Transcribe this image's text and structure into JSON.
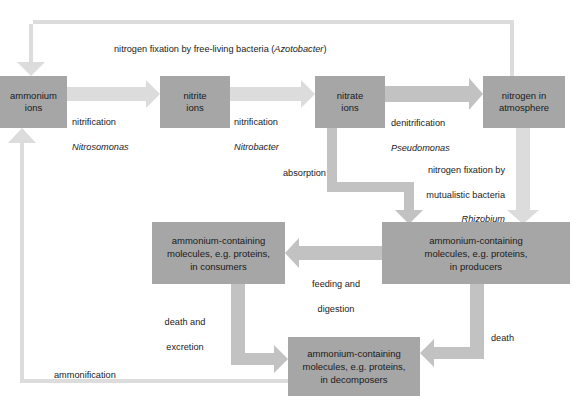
{
  "diagram": {
    "title_caption": "nitrogen fixation by free-living bacteria (Azotobacter)",
    "nodes": [
      {
        "id": "ammonium_ions",
        "label": "ammonium\nions"
      },
      {
        "id": "nitrite_ions",
        "label": "nitrite\nions"
      },
      {
        "id": "nitrate_ions",
        "label": "nitrate\nions"
      },
      {
        "id": "nitrogen_atmosphere",
        "label": "nitrogen in\natmosphere"
      },
      {
        "id": "consumers",
        "label": "ammonium-containing\nmolecules, e.g. proteins,\nin consumers"
      },
      {
        "id": "producers",
        "label": "ammonium-containing\nmolecules, e.g. proteins,\nin producers"
      },
      {
        "id": "decomposers",
        "label": "ammonium-containing\nmolecules, e.g. proteins,\nin decomposers"
      }
    ],
    "edge_labels": {
      "free_living_fixation": "nitrogen fixation by free-living bacteria (Azotobacter)",
      "free_living_fixation_plain": "nitrogen fixation by free-living bacteria (",
      "free_living_fixation_italic": "Azotobacter",
      "free_living_fixation_tail": ")",
      "nitrification_1_line1": "nitrification",
      "nitrification_1_line2": "Nitrosomonas",
      "nitrification_2_line1": "nitrification",
      "nitrification_2_line2": "Nitrobacter",
      "denitrification_line1": "denitrification",
      "denitrification_line2": "Pseudomonas",
      "absorption": "absorption",
      "mutualistic_line1": "nitrogen fixation by",
      "mutualistic_line2": "mutualistic bacteria",
      "mutualistic_line3": "Rhizobium",
      "feeding_line1": "feeding and",
      "feeding_line2": "digestion",
      "death_excretion_line1": "death and",
      "death_excretion_line2": "excretion",
      "death": "death",
      "ammonification": "ammonification"
    },
    "colors": {
      "node_fill": "#a6a6a6",
      "arrow_light": "#dcdcdc",
      "arrow_mid": "#c2c2c2",
      "background": "#ffffff",
      "text": "#1a1a1a"
    }
  }
}
